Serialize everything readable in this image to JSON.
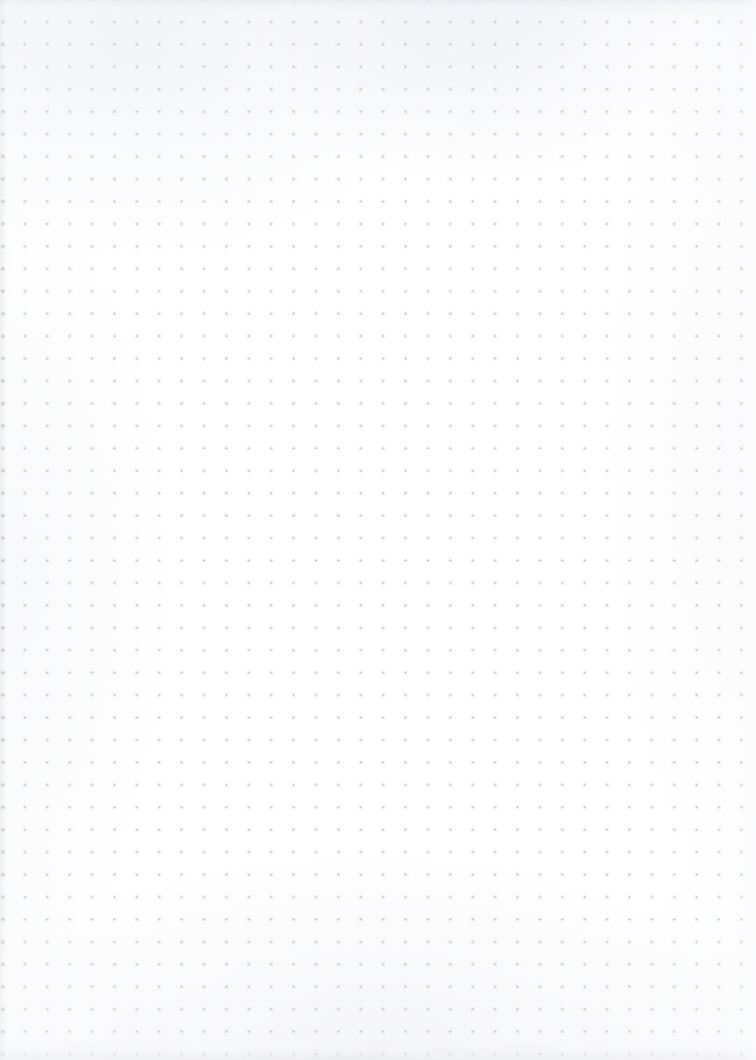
{
  "page": {
    "kind": "scanned-blank-dot-grid-notebook-page",
    "width_px": 756,
    "height_px": 1060,
    "background_color": "#fefeff",
    "paper_tint_color": "#fbfbfd",
    "text_content": "",
    "visible_text_elements": []
  },
  "grid": {
    "type": "dot-grid",
    "dot_color": "#a8aab6",
    "dot_halo_color": "#d6d8e2",
    "dot_diameter_px": 2.4,
    "spacing_x_px": 22.4,
    "spacing_y_px": 22.45,
    "origin_x_px": 2.5,
    "origin_y_px": 22.0,
    "columns": 34,
    "rows": 47,
    "right_margin_px": 13,
    "bottom_margin_px": 15
  },
  "artifacts": {
    "top_band": {
      "height_px": 14,
      "color": "#e4e6ec"
    },
    "bottom_band": {
      "height_px": 18,
      "color": "#e7e8ee"
    },
    "left_edge": {
      "width_px": 10,
      "color": "#e2e4eb"
    },
    "right_edge": {
      "width_px": 16,
      "color": "#fcfcfd"
    },
    "vignette_color": "#f4f5f8",
    "gutter_column_color": "#9a9cab",
    "smudges": [
      {
        "x": 60,
        "y": 1046,
        "w": 120,
        "h": 9
      },
      {
        "x": 235,
        "y": 1050,
        "w": 150,
        "h": 8
      },
      {
        "x": 430,
        "y": 1047,
        "w": 130,
        "h": 9
      },
      {
        "x": 600,
        "y": 1051,
        "w": 110,
        "h": 8
      },
      {
        "x": 120,
        "y": 4,
        "w": 160,
        "h": 8
      },
      {
        "x": 330,
        "y": 2,
        "w": 120,
        "h": 7
      },
      {
        "x": 520,
        "y": 5,
        "w": 170,
        "h": 8
      }
    ]
  }
}
